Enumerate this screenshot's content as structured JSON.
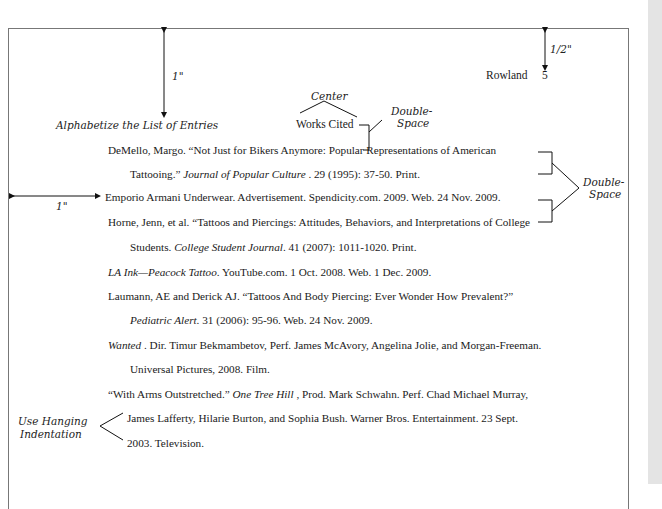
{
  "header": {
    "running_head": "Rowland",
    "page_number": "5"
  },
  "title": "Works Cited",
  "annotations": {
    "top_margin": "1\"",
    "header_margin": "1/2\"",
    "left_margin": "1\"",
    "center": "Center",
    "double_space_title_1": "Double-",
    "double_space_title_2": "Space",
    "double_space_entries_1": "Double-",
    "double_space_entries_2": "Space",
    "alphabetize": "Alphabetize the List of Entries",
    "hanging_1": "Use Hanging",
    "hanging_2": "Indentation"
  },
  "entries": [
    {
      "l1a": "DeMello, Margo. “Not Just for Bikers Anymore: Popular Representations of American",
      "l2a": "Tattooing.” ",
      "l2i": "Journal of Popular Culture",
      "l2b": " . 29 (1995): 37-50. Print."
    },
    {
      "l1a": "Emporio Armani Underwear. Advertisement. Spendicity.com. 2009. Web. 24 Nov. 2009."
    },
    {
      "l1a": "Horne, Jenn, et al. “Tattoos and Piercings: Attitudes, Behaviors, and Interpretations of College",
      "l2a": "Students. ",
      "l2i": "College Student Journal",
      "l2b": ". 41 (2007): 1011-1020. Print."
    },
    {
      "l1i": "LA Ink—Peacock Tattoo",
      "l1a": ". YouTube.com. 1 Oct. 2008. Web. 1 Dec. 2009."
    },
    {
      "l1a": "Laumann, AE and Derick AJ. “Tattoos And Body Piercing: Ever Wonder How Prevalent?”",
      "l2i": "Pediatric Alert",
      "l2b": ". 31 (2006): 95-96. Web. 24 Nov. 2009."
    },
    {
      "l1i": "Wanted",
      "l1a": " . Dir. Timur Bekmambetov, Perf. James McAvory, Angelina Jolie, and Morgan-Freeman.",
      "l2a": "Universal Pictures, 2008. Film."
    },
    {
      "l1a": "“With Arms Outstretched.” ",
      "l1i": "One Tree Hill",
      "l1b": " , Prod. Mark Schwahn. Perf. Chad Michael Murray,",
      "l2a": "James Lafferty, Hilarie Burton, and Sophia Bush. Warner Bros. Entertainment. 23 Sept.",
      "l3a": "2003. Television."
    }
  ]
}
